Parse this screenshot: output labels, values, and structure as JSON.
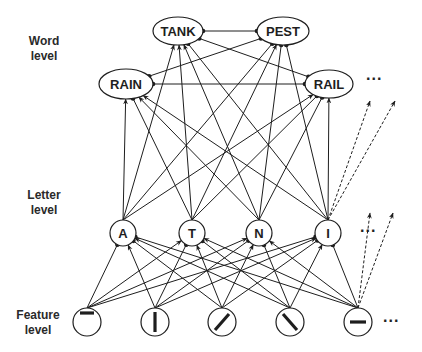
{
  "levels": {
    "word": {
      "label_line1": "Word",
      "label_line2": "level"
    },
    "letter": {
      "label_line1": "Letter",
      "label_line2": "level"
    },
    "feature": {
      "label_line1": "Feature",
      "label_line2": "level"
    }
  },
  "ellipsis": "...",
  "words": [
    {
      "id": "TANK",
      "label": "TANK"
    },
    {
      "id": "PEST",
      "label": "PEST"
    },
    {
      "id": "RAIN",
      "label": "RAIN"
    },
    {
      "id": "RAIL",
      "label": "RAIL"
    }
  ],
  "letters": [
    {
      "id": "A",
      "label": "A"
    },
    {
      "id": "T",
      "label": "T"
    },
    {
      "id": "N",
      "label": "N"
    },
    {
      "id": "I",
      "label": "I"
    }
  ],
  "features": [
    {
      "id": "f1",
      "glyph": "horizontal-top"
    },
    {
      "id": "f2",
      "glyph": "vertical"
    },
    {
      "id": "f3",
      "glyph": "diagonal-right"
    },
    {
      "id": "f4",
      "glyph": "diagonal-left"
    },
    {
      "id": "f5",
      "glyph": "horizontal-middle"
    }
  ],
  "legend": {
    "arrow": "excitatory connection",
    "dot": "inhibitory connection",
    "dashed_arrow": "connections to further units"
  },
  "colors": {
    "ink": "#1e1e1e",
    "background": "#ffffff"
  }
}
